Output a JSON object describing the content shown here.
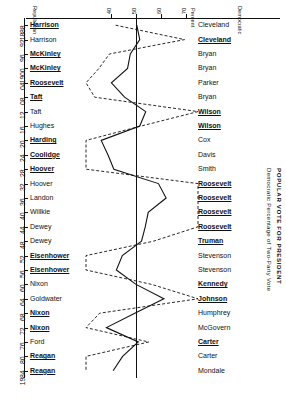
{
  "titles": {
    "main": "POPULAR VOTE FOR PRESIDENT",
    "axis_caption": "Democratic Percentage of Two-Party Vote",
    "header_left": "Republican",
    "header_right": "Democratic",
    "header_pct": "Percent"
  },
  "axis": {
    "x_ticks": [
      40,
      50,
      60,
      70
    ],
    "x_tick_labels": [
      "40",
      "50",
      "60",
      "70"
    ],
    "xlim": [
      30,
      75
    ],
    "reference_line": 50,
    "year_ticks": [
      "1888",
      "92",
      "96",
      "1900",
      "04",
      "08",
      "12",
      "16",
      "20",
      "24",
      "28",
      "32",
      "36",
      "40",
      "44",
      "48",
      "52",
      "56",
      "60",
      "64",
      "68",
      "72",
      "76",
      "80",
      "1984"
    ]
  },
  "legend": {
    "solid": "Popular vote",
    "dashed": "Electoral vote"
  },
  "chart_data": {
    "type": "line",
    "title": "POPULAR VOTE FOR PRESIDENT",
    "xlabel": "Democratic Percentage of Two-Party Vote",
    "ylabel": "Year",
    "xlim": [
      30,
      75
    ],
    "grid": false,
    "orientation": "horizontal-value-vertical-year",
    "reference_line": 50,
    "legend_position": "none",
    "categories": [
      "1888",
      "1892",
      "1896",
      "1900",
      "1904",
      "1908",
      "1912",
      "1916",
      "1920",
      "1924",
      "1928",
      "1932",
      "1936",
      "1940",
      "1944",
      "1948",
      "1952",
      "1956",
      "1960",
      "1964",
      "1968",
      "1972",
      "1976",
      "1980",
      "1984"
    ],
    "series": [
      {
        "name": "Popular vote",
        "style": "solid",
        "values": [
          50.4,
          51.6,
          47.8,
          46.7,
          40.2,
          45.5,
          54.0,
          51.6,
          36.1,
          38.8,
          41.2,
          59.1,
          62.2,
          55.0,
          53.8,
          52.3,
          44.6,
          42.2,
          50.1,
          61.3,
          49.6,
          38.2,
          51.0,
          44.7,
          40.9
        ],
        "unit": "% of two-party vote"
      },
      {
        "name": "Electoral vote",
        "style": "dashed",
        "values": [
          41.9,
          69.6,
          39.4,
          35.2,
          29.4,
          33.5,
          81.9,
          52.2,
          23.9,
          25.6,
          16.4,
          88.9,
          98.5,
          84.6,
          81.4,
          57.1,
          16.8,
          13.8,
          56.4,
          90.3,
          35.5,
          3.2,
          55.2,
          9.1,
          2.4
        ],
        "unit": "% of electoral vote"
      }
    ],
    "candidates": {
      "republican": [
        {
          "year": "1888",
          "name": "Harrison",
          "won": true
        },
        {
          "year": "1892",
          "name": "Harrison",
          "won": false
        },
        {
          "year": "1896",
          "name": "McKinley",
          "won": true
        },
        {
          "year": "1900",
          "name": "McKinley",
          "won": true
        },
        {
          "year": "1904",
          "name": "Roosevelt",
          "won": true
        },
        {
          "year": "1908",
          "name": "Taft",
          "won": true
        },
        {
          "year": "1912",
          "name": "Taft",
          "won": false
        },
        {
          "year": "1916",
          "name": "Hughes",
          "won": false
        },
        {
          "year": "1920",
          "name": "Harding",
          "won": true
        },
        {
          "year": "1924",
          "name": "Coolidge",
          "won": true
        },
        {
          "year": "1928",
          "name": "Hoover",
          "won": true
        },
        {
          "year": "1932",
          "name": "Hoover",
          "won": false
        },
        {
          "year": "1936",
          "name": "Landon",
          "won": false
        },
        {
          "year": "1940",
          "name": "Willkie",
          "won": false
        },
        {
          "year": "1944",
          "name": "Dewey",
          "won": false
        },
        {
          "year": "1948",
          "name": "Dewey",
          "won": false
        },
        {
          "year": "1952",
          "name": "Eisenhower",
          "won": true
        },
        {
          "year": "1956",
          "name": "Eisenhower",
          "won": true
        },
        {
          "year": "1960",
          "name": "Nixon",
          "won": false
        },
        {
          "year": "1964",
          "name": "Goldwater",
          "won": false
        },
        {
          "year": "1968",
          "name": "Nixon",
          "won": true
        },
        {
          "year": "1972",
          "name": "Nixon",
          "won": true
        },
        {
          "year": "1976",
          "name": "Ford",
          "won": false
        },
        {
          "year": "1980",
          "name": "Reagan",
          "won": true
        },
        {
          "year": "1984",
          "name": "Reagan",
          "won": true
        }
      ],
      "democratic": [
        {
          "year": "1888",
          "name": "Cleveland",
          "won": false
        },
        {
          "year": "1892",
          "name": "Cleveland",
          "won": true
        },
        {
          "year": "1896",
          "name": "Bryan",
          "won": false
        },
        {
          "year": "1900",
          "name": "Bryan",
          "won": false
        },
        {
          "year": "1904",
          "name": "Parker",
          "won": false
        },
        {
          "year": "1908",
          "name": "Bryan",
          "won": false
        },
        {
          "year": "1912",
          "name": "Wilson",
          "won": true
        },
        {
          "year": "1916",
          "name": "Wilson",
          "won": true
        },
        {
          "year": "1920",
          "name": "Cox",
          "won": false
        },
        {
          "year": "1924",
          "name": "Davis",
          "won": false
        },
        {
          "year": "1928",
          "name": "Smith",
          "won": false
        },
        {
          "year": "1932",
          "name": "Roosevelt",
          "won": true
        },
        {
          "year": "1936",
          "name": "Roosevelt",
          "won": true
        },
        {
          "year": "1940",
          "name": "Roosevelt",
          "won": true
        },
        {
          "year": "1944",
          "name": "Roosevelt",
          "won": true
        },
        {
          "year": "1948",
          "name": "Truman",
          "won": true
        },
        {
          "year": "1952",
          "name": "Stevenson",
          "won": false
        },
        {
          "year": "1956",
          "name": "Stevenson",
          "won": false
        },
        {
          "year": "1960",
          "name": "Kennedy",
          "won": true
        },
        {
          "year": "1964",
          "name": "Johnson",
          "won": true
        },
        {
          "year": "1968",
          "name": "Humphrey",
          "won": false
        },
        {
          "year": "1972",
          "name": "McGovern",
          "won": false
        },
        {
          "year": "1976",
          "name": "Carter",
          "won": true
        },
        {
          "year": "1980",
          "name": "Carter",
          "won": false
        },
        {
          "year": "1984",
          "name": "Mondale",
          "won": false
        }
      ]
    }
  },
  "colors": {
    "ink": "#111111",
    "paper": "#ffffff"
  }
}
